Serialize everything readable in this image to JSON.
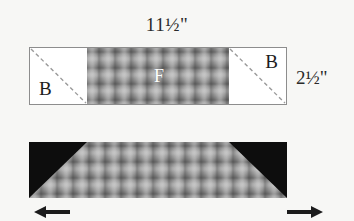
{
  "diagram": {
    "dimensions": {
      "length_label": "11½\"",
      "width_label": "2½\""
    },
    "top_assembly": {
      "left_block": {
        "label": "B",
        "name": "binding-square-left"
      },
      "right_block": {
        "label": "B",
        "name": "binding-square-right"
      },
      "center_fabric": {
        "label": "F",
        "name": "plaid-fabric-panel"
      },
      "stitch_line_style": "dashed-diagonal"
    },
    "bottom_assembly": {
      "center_fabric": {
        "label": "",
        "name": "plaid-fabric-strip"
      },
      "left_corner": {
        "label": "",
        "name": "black-corner-triangle-left"
      },
      "right_corner": {
        "label": "",
        "name": "black-corner-triangle-right"
      }
    },
    "arrows": {
      "left": "←",
      "right": "→"
    },
    "colors": {
      "background": "#f7f7f5",
      "outline": "#8d8d8d",
      "fabric_base": "#8d8d8d",
      "corner": "#0d0d0d",
      "text": "#1c1c1c",
      "fabric_label": "#ffffff"
    }
  }
}
